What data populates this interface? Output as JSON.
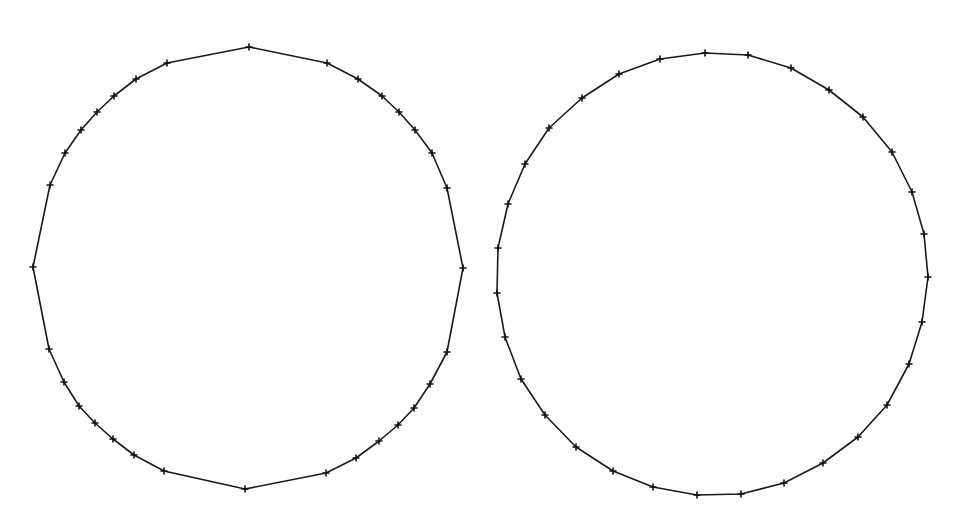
{
  "canvas": {
    "width": 967,
    "height": 518,
    "background": "#ffffff"
  },
  "style": {
    "stroke_color": "#1a1a1a",
    "marker_color": "#111111",
    "marker_size": 3
  },
  "figures": [
    {
      "name": "left-polygon",
      "description": "Coarse polygon approximation of a circle with point markers; long flat segments at top, bottom, left and right",
      "points": [
        [
          249,
          47
        ],
        [
          327,
          63
        ],
        [
          358,
          79
        ],
        [
          382,
          96
        ],
        [
          399,
          112
        ],
        [
          415,
          130
        ],
        [
          432,
          153
        ],
        [
          447,
          188
        ],
        [
          463,
          268
        ],
        [
          447,
          352
        ],
        [
          430,
          384
        ],
        [
          414,
          408
        ],
        [
          398,
          425
        ],
        [
          379,
          441
        ],
        [
          356,
          458
        ],
        [
          326,
          473
        ],
        [
          245,
          489
        ],
        [
          164,
          471
        ],
        [
          134,
          455
        ],
        [
          113,
          439
        ],
        [
          95,
          423
        ],
        [
          79,
          406
        ],
        [
          64,
          382
        ],
        [
          49,
          349
        ],
        [
          33,
          267
        ],
        [
          50,
          185
        ],
        [
          65,
          153
        ],
        [
          81,
          130
        ],
        [
          97,
          112
        ],
        [
          114,
          96
        ],
        [
          136,
          79
        ],
        [
          167,
          63
        ]
      ]
    },
    {
      "name": "right-polygon",
      "description": "Evenly sampled polygon approximation of a circle with point markers",
      "points": [
        [
          705,
          53
        ],
        [
          748,
          55
        ],
        [
          791,
          68
        ],
        [
          829,
          90
        ],
        [
          863,
          117
        ],
        [
          892,
          152
        ],
        [
          912,
          192
        ],
        [
          924,
          234
        ],
        [
          928,
          277
        ],
        [
          922,
          322
        ],
        [
          909,
          364
        ],
        [
          887,
          405
        ],
        [
          858,
          437
        ],
        [
          823,
          463
        ],
        [
          784,
          483
        ],
        [
          741,
          494
        ],
        [
          697,
          495
        ],
        [
          653,
          487
        ],
        [
          613,
          471
        ],
        [
          576,
          447
        ],
        [
          545,
          415
        ],
        [
          521,
          379
        ],
        [
          505,
          337
        ],
        [
          497,
          293
        ],
        [
          498,
          248
        ],
        [
          508,
          204
        ],
        [
          525,
          164
        ],
        [
          549,
          128
        ],
        [
          582,
          98
        ],
        [
          619,
          74
        ],
        [
          660,
          59
        ]
      ]
    }
  ]
}
